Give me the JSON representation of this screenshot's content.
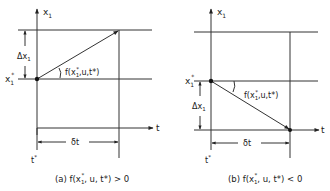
{
  "colors": {
    "ink": "#222222",
    "background": "#ffffff"
  },
  "panels": [
    {
      "id": "a",
      "axis_y_label": "x",
      "axis_y_sub": "1",
      "axis_x_label": "t",
      "x_star_label": "x",
      "x_star_sub": "1",
      "x_star_sup": "*",
      "delta_x_label": "Δx",
      "delta_x_sub": "1",
      "delta_t_label": "δt",
      "t_star_label": "t",
      "t_star_sup": "*",
      "slope_label_pre": "f(x",
      "slope_label_sup": "*",
      "slope_label_sub": "1",
      "slope_label_post": ",u,t*)",
      "caption_prefix": "(a) f(x",
      "caption_sup": "*",
      "caption_sub": "1",
      "caption_suffix": ", u, t*) > 0"
    },
    {
      "id": "b",
      "axis_y_label": "x",
      "axis_y_sub": "1",
      "axis_x_label": "t",
      "x_star_label": "x",
      "x_star_sub": "1",
      "x_star_sup": "*",
      "delta_x_label": "Δx",
      "delta_x_sub": "1",
      "delta_t_label": "δt",
      "t_star_label": "t",
      "t_star_sup": "*",
      "slope_label_pre": "f(x",
      "slope_label_sup": "*",
      "slope_label_sub": "1",
      "slope_label_post": ",u,t*)",
      "caption_prefix": "(b) f(x",
      "caption_sup": "*",
      "caption_sub": "1",
      "caption_suffix": ", u, t*) < 0"
    }
  ]
}
